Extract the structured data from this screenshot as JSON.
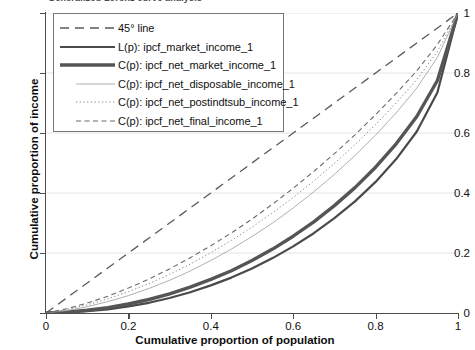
{
  "title": "Generalized Lorenz curve analysis",
  "axes": {
    "x_title": "Cumulative proportion of population",
    "y_title": "Cumulative proportion of income",
    "x_ticks": [
      "0",
      "0.2",
      "0.4",
      "0.6",
      "0.8",
      "1"
    ],
    "y_ticks": [
      "0",
      "0.2",
      "0.4",
      "0.6",
      "0.8",
      "1"
    ]
  },
  "legend": {
    "items": [
      {
        "label": "45° line",
        "style": "dashed-long",
        "width": 1.3,
        "color": "#5a5a5a"
      },
      {
        "label": "L(p): ipcf_market_income_1",
        "style": "solid",
        "width": 2.2,
        "color": "#4a4a4a"
      },
      {
        "label": "C(p): ipcf_net_market_income_1",
        "style": "solid",
        "width": 3.4,
        "color": "#555555"
      },
      {
        "label": "C(p): ipcf_net_disposable_income_1",
        "style": "solid",
        "width": 0.8,
        "color": "#9a9a9a"
      },
      {
        "label": "C(p): ipcf_net_postindtsub_income_1",
        "style": "dotted",
        "width": 1.0,
        "color": "#8a8a8a"
      },
      {
        "label": "C(p): ipcf_net_final_income_1",
        "style": "dashed-short",
        "width": 1.1,
        "color": "#6b6b6b"
      }
    ]
  },
  "colors": {
    "axis": "#4d4d4d",
    "grid": "#e4e4e4",
    "background": "#ffffff",
    "text": "#111111"
  },
  "chart_data": {
    "type": "line",
    "title": "Generalized Lorenz curve analysis",
    "xlabel": "Cumulative proportion of population",
    "ylabel": "Cumulative proportion of income",
    "xlim": [
      0,
      1
    ],
    "ylim": [
      0,
      1
    ],
    "grid": true,
    "legend_position": "upper-left",
    "x": [
      0,
      0.05,
      0.1,
      0.15,
      0.2,
      0.25,
      0.3,
      0.35,
      0.4,
      0.45,
      0.5,
      0.55,
      0.6,
      0.65,
      0.7,
      0.75,
      0.8,
      0.85,
      0.9,
      0.95,
      1
    ],
    "series": [
      {
        "name": "45° line",
        "style": "dashed-long",
        "values": [
          0,
          0.05,
          0.1,
          0.15,
          0.2,
          0.25,
          0.3,
          0.35,
          0.4,
          0.45,
          0.5,
          0.55,
          0.6,
          0.65,
          0.7,
          0.75,
          0.8,
          0.85,
          0.9,
          0.95,
          1
        ]
      },
      {
        "name": "L(p): ipcf_market_income_1",
        "style": "solid",
        "values": [
          0,
          0.002,
          0.006,
          0.012,
          0.022,
          0.034,
          0.05,
          0.069,
          0.092,
          0.118,
          0.148,
          0.183,
          0.222,
          0.266,
          0.316,
          0.372,
          0.437,
          0.513,
          0.605,
          0.735,
          1
        ]
      },
      {
        "name": "C(p): ipcf_net_market_income_1",
        "style": "solid",
        "values": [
          0,
          0.003,
          0.009,
          0.018,
          0.03,
          0.045,
          0.064,
          0.086,
          0.112,
          0.141,
          0.175,
          0.213,
          0.256,
          0.304,
          0.358,
          0.418,
          0.486,
          0.564,
          0.655,
          0.775,
          1
        ]
      },
      {
        "name": "C(p): ipcf_net_disposable_income_1",
        "style": "solid",
        "values": [
          0,
          0.008,
          0.021,
          0.038,
          0.058,
          0.082,
          0.109,
          0.14,
          0.175,
          0.213,
          0.255,
          0.3,
          0.35,
          0.404,
          0.462,
          0.525,
          0.593,
          0.667,
          0.75,
          0.852,
          1
        ]
      },
      {
        "name": "C(p): ipcf_net_postindtsub_income_1",
        "style": "dotted",
        "values": [
          0,
          0.011,
          0.027,
          0.047,
          0.071,
          0.098,
          0.129,
          0.163,
          0.201,
          0.242,
          0.286,
          0.334,
          0.385,
          0.44,
          0.499,
          0.561,
          0.628,
          0.7,
          0.778,
          0.872,
          1
        ]
      },
      {
        "name": "C(p): ipcf_net_final_income_1",
        "style": "dashed-short",
        "values": [
          0,
          0.014,
          0.033,
          0.056,
          0.083,
          0.113,
          0.147,
          0.184,
          0.224,
          0.267,
          0.313,
          0.363,
          0.416,
          0.472,
          0.531,
          0.594,
          0.661,
          0.732,
          0.807,
          0.895,
          1
        ]
      }
    ]
  }
}
